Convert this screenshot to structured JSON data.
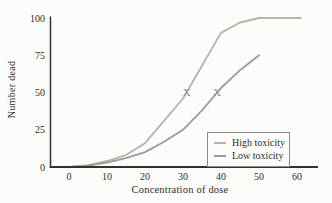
{
  "chart_data": {
    "type": "line",
    "title": "",
    "xlabel": "Concentration of dose",
    "ylabel": "Number dead",
    "xlim": [
      -5,
      65
    ],
    "ylim": [
      0,
      100
    ],
    "xticks": [
      0,
      10,
      20,
      30,
      40,
      50,
      60
    ],
    "yticks": [
      0,
      25,
      50,
      75,
      100
    ],
    "grid": false,
    "legend_position": "lower right",
    "series": [
      {
        "name": "High toxicity",
        "color": "#b7b3aa",
        "x": [
          0,
          5,
          10,
          15,
          20,
          25,
          30,
          35,
          40,
          45,
          50,
          61
        ],
        "y": [
          0,
          1,
          4,
          8,
          16,
          31,
          46,
          68,
          90,
          97,
          100,
          100
        ]
      },
      {
        "name": "Low toxicity",
        "color": "#9a9e97",
        "x": [
          0,
          5,
          10,
          15,
          20,
          25,
          30,
          35,
          40,
          45,
          50
        ],
        "y": [
          0,
          1,
          3,
          6,
          10,
          17,
          25,
          38,
          53,
          65,
          75
        ]
      }
    ],
    "markers": [
      {
        "symbol": "X",
        "x": 31,
        "y": 50,
        "series": "High toxicity"
      },
      {
        "symbol": "X",
        "x": 39,
        "y": 50,
        "series": "Low toxicity"
      }
    ],
    "colors": {
      "axis": "#34322d",
      "text": "#2f2d29",
      "marker": "#8c8c8a",
      "legend_border": "#8b8b87",
      "background": "#fcfcfa"
    }
  }
}
